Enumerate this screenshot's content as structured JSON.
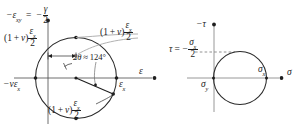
{
  "figure": {
    "ink_color": "#1f1f1f",
    "axis_color": "#3a3a3a",
    "leader_color": "#9a9a9a"
  },
  "strain_diagram": {
    "name": "mohr-circle-strain",
    "vertical_axis_label": {
      "prefix_minus": "−",
      "symbol": "ε",
      "subscript": "xy",
      "equals": "=",
      "rhs_minus": "−",
      "rhs_numerator": "γ",
      "rhs_denominator": "2",
      "full_text": "−εxy = −γ/2"
    },
    "horizontal_axis_label": "ε",
    "left_axis_value": {
      "minus": "−",
      "nu": "v",
      "epsilon": "ε",
      "subscript": "x",
      "full_text": "−vεx"
    },
    "right_axis_value": {
      "epsilon": "ε",
      "subscript": "x",
      "full_text": "εx"
    },
    "radius_label_upper_left": {
      "lead": "(1 + v)",
      "numerator_symbol": "ε",
      "numerator_subscript": "x",
      "denominator": "2",
      "full_text": "(1 + v)εx/2"
    },
    "radius_label_upper_right": {
      "lead": "(1 + v)",
      "numerator_symbol": "ε",
      "numerator_subscript": "x",
      "denominator": "2",
      "full_text": "(1 + v)εx/2"
    },
    "radius_label_lower": {
      "lead": "(1 + v)",
      "numerator_symbol": "ε",
      "numerator_subscript": "x",
      "denominator": "2",
      "full_text": "(1 + v)εx/2"
    },
    "angle_annotation": {
      "symbol": "2θ",
      "relation": "≈",
      "value": "124",
      "unit": "°",
      "full_text": "2θ ≈ 124°"
    }
  },
  "stress_diagram": {
    "name": "mohr-circle-stress",
    "vertical_axis_label": {
      "minus": "−",
      "symbol": "τ",
      "full_text": "−τ"
    },
    "horizontal_axis_label": "σ",
    "tau_value_label": {
      "symbol": "τ",
      "equals": "=",
      "minus": "−",
      "numerator_symbol": "σ",
      "numerator_subscript": "x",
      "denominator": "2",
      "full_text": "τ = −σx/2"
    },
    "sigma_y_label": {
      "symbol": "σ",
      "subscript": "y",
      "full_text": "σy"
    },
    "sigma_x_label": {
      "symbol": "σ",
      "subscript": "x",
      "full_text": "σx"
    }
  }
}
